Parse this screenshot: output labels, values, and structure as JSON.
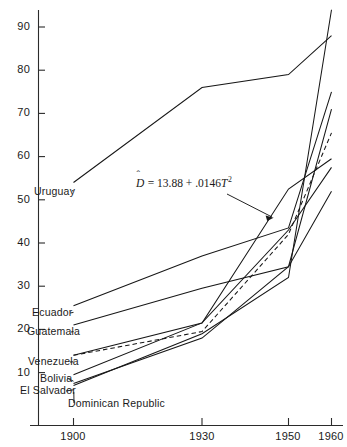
{
  "chart_data": {
    "type": "line",
    "title": "",
    "subtitle": "",
    "xlabel": "",
    "ylabel": "",
    "x": [
      1900,
      1930,
      1950,
      1960
    ],
    "xtick_labels": [
      "1900",
      "1930",
      "1950",
      "1960"
    ],
    "ytick_labels": [
      "10",
      "20",
      "30",
      "40",
      "50",
      "60",
      "70",
      "80",
      "90"
    ],
    "ytick_values": [
      10,
      20,
      30,
      40,
      50,
      60,
      70,
      80,
      90
    ],
    "xlim": [
      1890,
      1962
    ],
    "ylim": [
      2,
      96
    ],
    "grid": false,
    "legend_position": "inline-left-labels",
    "series": [
      {
        "name": "Uruguay",
        "label": "Uruguay",
        "style": "solid",
        "values": [
          54,
          76,
          79,
          88
        ]
      },
      {
        "name": "Ecuador",
        "label": "Ecuador",
        "style": "solid",
        "values": [
          25.5,
          37,
          43.5,
          75
        ]
      },
      {
        "name": "Guatemala",
        "label": "Guatemala",
        "style": "solid",
        "values": [
          21,
          29.5,
          34.5,
          71
        ]
      },
      {
        "name": "Venezuela",
        "label": "Venezuela",
        "style": "solid",
        "values": [
          14,
          21.5,
          52.5,
          59.5
        ]
      },
      {
        "name": "Bolivia",
        "label": "Bolivia",
        "style": "solid",
        "values": [
          9.5,
          21.5,
          43,
          57.5
        ]
      },
      {
        "name": "El Salvador",
        "label": "El Salvador",
        "style": "solid",
        "values": [
          7.5,
          18,
          34.5,
          52
        ]
      },
      {
        "name": "Dominican Republic",
        "label": "Dominican Republic",
        "style": "solid",
        "values": [
          7,
          19,
          32,
          94
        ]
      },
      {
        "name": "fitted",
        "label": "",
        "style": "dashed",
        "values": [
          14,
          19.5,
          42,
          65.5
        ]
      }
    ],
    "annotations": [
      {
        "name": "regression-equation",
        "text": "D̂ = 13.88 + .0146T²",
        "lhs": "D",
        "hat": "ˆ",
        "body": " = 13.88 + .0146",
        "term_var": "T",
        "exponent": "2",
        "points_to": "fitted"
      }
    ]
  },
  "axes": {
    "y": {
      "ticks": [
        {
          "label": "90",
          "value": 90
        },
        {
          "label": "80",
          "value": 80
        },
        {
          "label": "70",
          "value": 70
        },
        {
          "label": "60",
          "value": 60
        },
        {
          "label": "50",
          "value": 50
        },
        {
          "label": "40",
          "value": 40
        },
        {
          "label": "30",
          "value": 30
        },
        {
          "label": "20",
          "value": 20
        },
        {
          "label": "10",
          "value": 10
        }
      ]
    },
    "x": {
      "ticks": [
        {
          "label": "1900",
          "value": 1900
        },
        {
          "label": "1930",
          "value": 1930
        },
        {
          "label": "1950",
          "value": 1950
        },
        {
          "label": "1960",
          "value": 1960
        }
      ]
    }
  },
  "series_labels": [
    {
      "name": "Uruguay",
      "text": "Uruguay"
    },
    {
      "name": "Ecuador",
      "text": "Ecuador"
    },
    {
      "name": "Guatemala",
      "text": "Guatemala"
    },
    {
      "name": "Venezuela",
      "text": "Venezuela"
    },
    {
      "name": "Bolivia",
      "text": "Bolivia"
    },
    {
      "name": "El Salvador",
      "text": "El Salvador"
    },
    {
      "name": "Dominican Republic",
      "text": "Dominican Republic"
    }
  ],
  "colors": {
    "line": "#171717",
    "axis": "#2b2b2b",
    "background": "#ffffff",
    "text": "#1a1a1a"
  }
}
